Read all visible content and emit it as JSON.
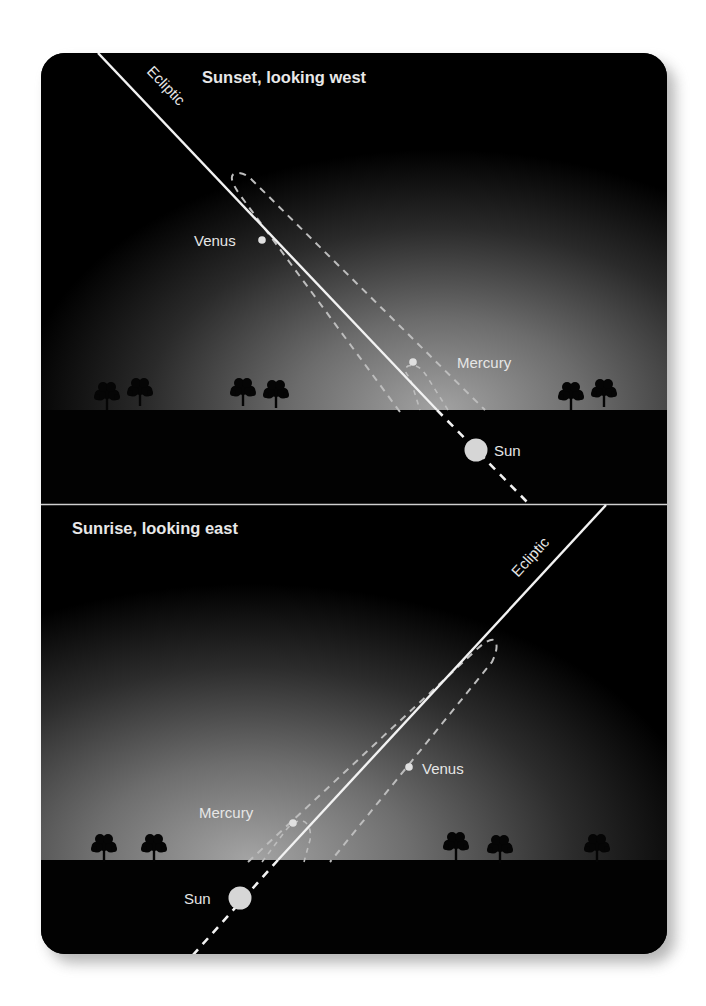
{
  "colors": {
    "page_bg": "#ffffff",
    "panel_bg": "#000000",
    "ground": "#020202",
    "sky_glow": "#9a9a9a",
    "line": "#f2f2f2",
    "dashed_orbit": "#bdbdbd",
    "label": "#e6e6e6",
    "sun": "#d6d6d6",
    "divider": "#d0d0d0"
  },
  "top_panel": {
    "title": "Sunset, looking west",
    "ecliptic_label": "Ecliptic",
    "labels": {
      "venus": "Venus",
      "mercury": "Mercury",
      "sun": "Sun"
    }
  },
  "bottom_panel": {
    "title": "Sunrise, looking east",
    "ecliptic_label": "Ecliptic",
    "labels": {
      "venus": "Venus",
      "mercury": "Mercury",
      "sun": "Sun"
    }
  }
}
